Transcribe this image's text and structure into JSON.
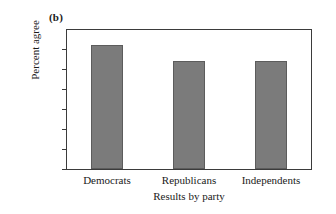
{
  "panel": {
    "label": "(b)"
  },
  "chart_data": {
    "type": "bar",
    "title": "(b)",
    "categories": [
      "Democrats",
      "Republicans",
      "Independents"
    ],
    "values": [
      62,
      54,
      54
    ],
    "xlabel": "Results by party",
    "ylabel": "Percent agree",
    "ylim": [
      0,
      65
    ],
    "yticks": [
      0,
      10,
      20,
      30,
      40,
      50,
      60
    ],
    "ytick_labels": [
      "0",
      "10",
      "20",
      "30",
      "40",
      "50",
      "60"
    ],
    "grid": false,
    "legend": null,
    "bar_color": "#7b7b7b",
    "bar_edge_color": "#5c5c5c",
    "frame_color": "#3b3b3b"
  }
}
